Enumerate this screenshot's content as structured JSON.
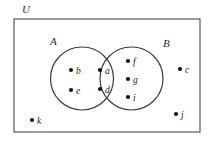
{
  "diagram": {
    "type": "venn-diagram",
    "universal_set": {
      "label": "U",
      "label_x": 22,
      "label_y": 13,
      "rect": {
        "x": 14,
        "y": 19,
        "width": 186,
        "height": 113
      }
    },
    "sets": [
      {
        "id": "A",
        "label": "A",
        "label_x": 50,
        "label_y": 45,
        "circle": {
          "cx": 82,
          "cy": 78.5,
          "r": 31.5
        }
      },
      {
        "id": "B",
        "label": "B",
        "label_x": 163,
        "label_y": 47,
        "circle": {
          "cx": 131.5,
          "cy": 78.5,
          "r": 31.5
        }
      }
    ],
    "elements": [
      {
        "label": "a",
        "dot_x": 100,
        "dot_y": 70,
        "text_x": 105,
        "text_y": 73.5,
        "region": "A-intersect-B"
      },
      {
        "label": "d",
        "dot_x": 100,
        "dot_y": 89,
        "text_x": 105,
        "text_y": 92.5,
        "region": "A-intersect-B"
      },
      {
        "label": "b",
        "dot_x": 71,
        "dot_y": 70,
        "text_x": 76,
        "text_y": 73.5,
        "region": "A-only"
      },
      {
        "label": "e",
        "dot_x": 71,
        "dot_y": 90,
        "text_x": 76,
        "text_y": 93.5,
        "region": "A-only"
      },
      {
        "label": "f",
        "dot_x": 128,
        "dot_y": 61,
        "text_x": 133,
        "text_y": 64.5,
        "region": "B-only"
      },
      {
        "label": "g",
        "dot_x": 128,
        "dot_y": 79,
        "text_x": 133,
        "text_y": 82.5,
        "region": "B-only"
      },
      {
        "label": "i",
        "dot_x": 128,
        "dot_y": 97,
        "text_x": 133,
        "text_y": 100.5,
        "region": "B-only"
      },
      {
        "label": "c",
        "dot_x": 180,
        "dot_y": 69,
        "text_x": 185,
        "text_y": 72.5,
        "region": "universal-only"
      },
      {
        "label": "j",
        "dot_x": 176,
        "dot_y": 114,
        "text_x": 181,
        "text_y": 117.5,
        "region": "universal-only"
      },
      {
        "label": "k",
        "dot_x": 32,
        "dot_y": 120,
        "text_x": 37,
        "text_y": 123.5,
        "region": "universal-only"
      }
    ],
    "style": {
      "stroke_color": "#3a3a3a",
      "rect_stroke_color": "#585858",
      "dot_color": "#141414",
      "text_color": "#1c1c1c",
      "background": "#ffffff",
      "stroke_width": 1.2,
      "dot_radius": 2.1
    }
  }
}
